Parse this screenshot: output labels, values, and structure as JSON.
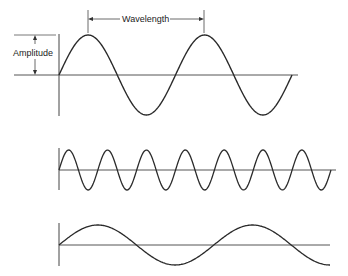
{
  "figure": {
    "labels": {
      "wavelength": "Wavelength",
      "amplitude": "Amplitude"
    },
    "colors": {
      "stroke": "#2a2a2a",
      "axis": "#555555",
      "background": "#ffffff"
    },
    "waves": [
      {
        "name": "reference-wave",
        "description": "Sine wave, 2 cycles",
        "cycles": 2,
        "relative_frequency": "medium",
        "amplitude": "equal"
      },
      {
        "name": "high-frequency-wave",
        "description": "Sine wave, 7 cycles (shorter wavelength)",
        "cycles": 7,
        "relative_frequency": "high",
        "amplitude": "equal"
      },
      {
        "name": "low-frequency-wave",
        "description": "Sine wave, 1.75 cycles (longer wavelength)",
        "cycles": 1.75,
        "relative_frequency": "low",
        "amplitude": "equal"
      }
    ]
  }
}
